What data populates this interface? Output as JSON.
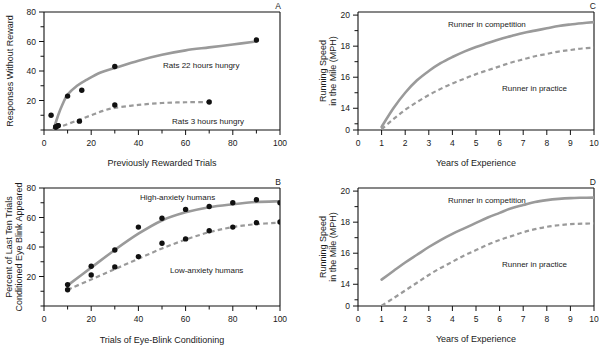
{
  "figure": {
    "panels": [
      "A",
      "B",
      "C",
      "D"
    ]
  },
  "chart_data": [
    {
      "type": "scatter",
      "panel": "A",
      "title": "",
      "xlabel": "Previously Rewarded Trials",
      "ylabel": "Responses Without Reward",
      "xlim": [
        0,
        100
      ],
      "ylim": [
        0,
        80
      ],
      "xticks": [
        0,
        10,
        20,
        30,
        40,
        50,
        60,
        70,
        80,
        90,
        100
      ],
      "xticklabels": [
        "0",
        "",
        "20",
        "",
        "40",
        "",
        "60",
        "",
        "80",
        "",
        "100"
      ],
      "yticks": [
        0,
        10,
        20,
        30,
        40,
        50,
        60,
        70,
        80
      ],
      "yticklabels": [
        "",
        "",
        "20",
        "",
        "40",
        "",
        "60",
        "",
        "80"
      ],
      "grid": false,
      "legend_position": "inline-annotation",
      "series": [
        {
          "name": "Rats 22 hours hungry",
          "style": "solid",
          "color": "#9a9a9a",
          "points": [
            [
              3,
              10
            ],
            [
              5,
              2
            ],
            [
              6,
              3
            ],
            [
              10,
              23
            ],
            [
              16,
              27
            ],
            [
              30,
              43
            ],
            [
              90,
              61
            ]
          ],
          "curve": [
            [
              4,
              0
            ],
            [
              6,
              10
            ],
            [
              8,
              18
            ],
            [
              10,
              24
            ],
            [
              14,
              30
            ],
            [
              18,
              34
            ],
            [
              24,
              39
            ],
            [
              30,
              42
            ],
            [
              40,
              47
            ],
            [
              50,
              51
            ],
            [
              60,
              54
            ],
            [
              70,
              56
            ],
            [
              80,
              58
            ],
            [
              90,
              60
            ]
          ]
        },
        {
          "name": "Rats 3 hours hungry",
          "style": "dashed",
          "color": "#9a9a9a",
          "points": [
            [
              5,
              2
            ],
            [
              6,
              3
            ],
            [
              15,
              6
            ],
            [
              30,
              17
            ],
            [
              70,
              19
            ]
          ],
          "curve": [
            [
              5,
              1
            ],
            [
              10,
              4
            ],
            [
              15,
              7
            ],
            [
              20,
              10
            ],
            [
              25,
              13
            ],
            [
              30,
              15
            ],
            [
              40,
              17
            ],
            [
              50,
              18.3
            ],
            [
              60,
              18.8
            ],
            [
              70,
              19
            ]
          ]
        }
      ]
    },
    {
      "type": "scatter",
      "panel": "B",
      "title": "",
      "xlabel": "Trials of Eye-Blink Conditioning",
      "ylabel": "Percent of Last Ten Trials Conditioned Eye Blink Appeared",
      "ylabel_line1": "Percent of Last Ten Trials",
      "ylabel_line2": "Conditioned Eye Blink Appeared",
      "xlim": [
        0,
        100
      ],
      "ylim": [
        0,
        80
      ],
      "xticks": [
        0,
        10,
        20,
        30,
        40,
        50,
        60,
        70,
        80,
        90,
        100
      ],
      "xticklabels": [
        "0",
        "",
        "20",
        "",
        "40",
        "",
        "60",
        "",
        "80",
        "",
        "100"
      ],
      "yticks": [
        0,
        10,
        20,
        30,
        40,
        50,
        60,
        70,
        80
      ],
      "yticklabels": [
        "",
        "",
        "20",
        "",
        "40",
        "",
        "60",
        "",
        "80"
      ],
      "grid": false,
      "legend_position": "inline-annotation",
      "series": [
        {
          "name": "High-anxiety humans",
          "style": "solid",
          "color": "#9a9a9a",
          "points": [
            [
              10,
              14.5
            ],
            [
              20,
              27
            ],
            [
              30,
              38
            ],
            [
              40,
              53.5
            ],
            [
              50,
              59.5
            ],
            [
              60,
              65.5
            ],
            [
              70,
              67.5
            ],
            [
              80,
              70
            ],
            [
              90,
              72
            ],
            [
              100,
              70
            ]
          ],
          "curve": [
            [
              10,
              14
            ],
            [
              20,
              26
            ],
            [
              30,
              38
            ],
            [
              40,
              49
            ],
            [
              50,
              58
            ],
            [
              60,
              63.5
            ],
            [
              70,
              67
            ],
            [
              80,
              69
            ],
            [
              90,
              70.5
            ],
            [
              100,
              71
            ]
          ]
        },
        {
          "name": "Low-anxiety humans",
          "style": "dashed",
          "color": "#9a9a9a",
          "points": [
            [
              10,
              11
            ],
            [
              20,
              21
            ],
            [
              30,
              26.5
            ],
            [
              40,
              33.5
            ],
            [
              50,
              42.5
            ],
            [
              60,
              45.5
            ],
            [
              70,
              51
            ],
            [
              80,
              53.5
            ],
            [
              90,
              56.5
            ],
            [
              100,
              57
            ]
          ],
          "curve": [
            [
              10,
              11
            ],
            [
              20,
              18
            ],
            [
              30,
              25
            ],
            [
              40,
              32
            ],
            [
              50,
              39
            ],
            [
              60,
              45
            ],
            [
              70,
              50
            ],
            [
              80,
              53.5
            ],
            [
              90,
              55.5
            ],
            [
              100,
              56.5
            ]
          ]
        }
      ]
    },
    {
      "type": "line",
      "panel": "C",
      "title": "",
      "xlabel": "Years of Experience",
      "ylabel": "Running Speed in the Mile (MPH)",
      "ylabel_line1": "Running Speed",
      "ylabel_line2": "in the Mile (MPH)",
      "xlim": [
        0,
        10
      ],
      "ylim": [
        12.6,
        20.2
      ],
      "xticks": [
        0,
        1,
        2,
        3,
        4,
        5,
        6,
        7,
        8,
        9,
        10
      ],
      "xticklabels": [
        "0",
        "1",
        "2",
        "3",
        "4",
        "5",
        "6",
        "7",
        "8",
        "9",
        "10"
      ],
      "yticks": [
        13,
        14,
        15,
        16,
        17,
        18,
        19,
        20
      ],
      "yticklabels": [
        "",
        "14",
        "",
        "16",
        "",
        "18",
        "",
        "20"
      ],
      "y_axis_broken": true,
      "y_zero_label": "0",
      "grid": false,
      "legend_position": "inline-annotation",
      "series": [
        {
          "name": "Runner in competition",
          "style": "solid",
          "color": "#9a9a9a",
          "curve": [
            [
              1,
              12.8
            ],
            [
              1.5,
              14.0
            ],
            [
              2,
              15.0
            ],
            [
              2.5,
              15.8
            ],
            [
              3,
              16.4
            ],
            [
              3.5,
              16.9
            ],
            [
              4,
              17.3
            ],
            [
              4.5,
              17.65
            ],
            [
              5,
              17.95
            ],
            [
              5.5,
              18.2
            ],
            [
              6,
              18.45
            ],
            [
              6.5,
              18.65
            ],
            [
              7,
              18.85
            ],
            [
              7.5,
              19.0
            ],
            [
              8,
              19.15
            ],
            [
              8.5,
              19.3
            ],
            [
              9,
              19.4
            ],
            [
              9.5,
              19.48
            ],
            [
              10,
              19.55
            ]
          ]
        },
        {
          "name": "Runner in practice",
          "style": "dashed",
          "color": "#9a9a9a",
          "curve": [
            [
              1,
              12.65
            ],
            [
              1.5,
              13.3
            ],
            [
              2,
              13.9
            ],
            [
              2.5,
              14.4
            ],
            [
              3,
              14.85
            ],
            [
              3.5,
              15.25
            ],
            [
              4,
              15.6
            ],
            [
              4.5,
              15.9
            ],
            [
              5,
              16.2
            ],
            [
              5.5,
              16.45
            ],
            [
              6,
              16.7
            ],
            [
              6.5,
              16.95
            ],
            [
              7,
              17.15
            ],
            [
              7.5,
              17.35
            ],
            [
              8,
              17.5
            ],
            [
              8.5,
              17.65
            ],
            [
              9,
              17.75
            ],
            [
              9.5,
              17.85
            ],
            [
              10,
              17.9
            ]
          ]
        }
      ]
    },
    {
      "type": "line",
      "panel": "D",
      "title": "",
      "xlabel": "Years of Experience",
      "ylabel": "Running Speed in the Mile (MPH)",
      "ylabel_line1": "Running Speed",
      "ylabel_line2": "in the Mile (MPH)",
      "xlim": [
        0,
        10
      ],
      "ylim": [
        12.6,
        20.2
      ],
      "xticks": [
        0,
        1,
        2,
        3,
        4,
        5,
        6,
        7,
        8,
        9,
        10
      ],
      "xticklabels": [
        "0",
        "1",
        "2",
        "3",
        "4",
        "5",
        "6",
        "7",
        "8",
        "9",
        "10"
      ],
      "yticks": [
        13,
        14,
        15,
        16,
        17,
        18,
        19,
        20
      ],
      "yticklabels": [
        "",
        "14",
        "",
        "16",
        "",
        "18",
        "",
        "20"
      ],
      "y_axis_broken": true,
      "y_zero_label": "0",
      "grid": false,
      "legend_position": "inline-annotation",
      "series": [
        {
          "name": "Runner in competition",
          "style": "solid",
          "color": "#9a9a9a",
          "curve": [
            [
              1,
              14.3
            ],
            [
              1.5,
              14.85
            ],
            [
              2,
              15.4
            ],
            [
              2.5,
              15.9
            ],
            [
              3,
              16.4
            ],
            [
              3.5,
              16.85
            ],
            [
              4,
              17.25
            ],
            [
              4.5,
              17.6
            ],
            [
              5,
              17.95
            ],
            [
              5.5,
              18.3
            ],
            [
              6,
              18.6
            ],
            [
              6.5,
              18.9
            ],
            [
              7,
              19.1
            ],
            [
              7.5,
              19.3
            ],
            [
              8,
              19.42
            ],
            [
              8.5,
              19.5
            ],
            [
              9,
              19.55
            ],
            [
              9.5,
              19.57
            ],
            [
              10,
              19.58
            ]
          ]
        },
        {
          "name": "Runner in practice",
          "style": "dashed",
          "color": "#9a9a9a",
          "curve": [
            [
              1,
              12.62
            ],
            [
              1.5,
              13.1
            ],
            [
              2,
              13.6
            ],
            [
              2.5,
              14.1
            ],
            [
              3,
              14.6
            ],
            [
              3.5,
              15.05
            ],
            [
              4,
              15.45
            ],
            [
              4.5,
              15.85
            ],
            [
              5,
              16.2
            ],
            [
              5.5,
              16.55
            ],
            [
              6,
              16.85
            ],
            [
              6.5,
              17.1
            ],
            [
              7,
              17.35
            ],
            [
              7.5,
              17.55
            ],
            [
              8,
              17.7
            ],
            [
              8.5,
              17.8
            ],
            [
              9,
              17.87
            ],
            [
              9.5,
              17.9
            ],
            [
              10,
              17.92
            ]
          ]
        }
      ]
    }
  ]
}
